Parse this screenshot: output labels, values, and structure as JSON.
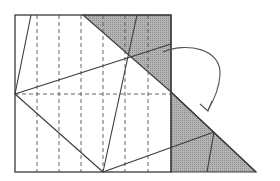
{
  "diagram": {
    "title": "",
    "type": "origami-fold-diagram",
    "colors": {
      "background": "#ffffff",
      "line": "#3a3a3a",
      "dashed": "#555555",
      "shade": "#a8a8a8"
    },
    "square": {
      "x1": 15,
      "y1": 15,
      "x2": 171,
      "y2": 172
    },
    "vertical_valley_folds_x": [
      37,
      59,
      81,
      103,
      125,
      148
    ],
    "horizontal_valley_fold_y": 94,
    "shaded_regions": [
      {
        "name": "top-right-flap",
        "points": "83,15 171,15 171,92"
      },
      {
        "name": "folded-triangle",
        "points": "171,92 256,172 171,172"
      }
    ],
    "crease_lines": [
      {
        "name": "left-top-edge-line",
        "x1": 31,
        "y1": 15,
        "x2": 15,
        "y2": 94
      },
      {
        "name": "left-to-bottom-diagonal",
        "x1": 15,
        "y1": 94,
        "x2": 103,
        "y2": 172
      },
      {
        "name": "left-to-right-rising",
        "x1": 15,
        "y1": 94,
        "x2": 171,
        "y2": 44
      },
      {
        "name": "top-to-bottom-steep",
        "x1": 137,
        "y1": 15,
        "x2": 103,
        "y2": 172
      },
      {
        "name": "bottom-to-triangle-rising",
        "x1": 103,
        "y1": 172,
        "x2": 214,
        "y2": 132
      },
      {
        "name": "triangle-inner-line",
        "x1": 214,
        "y1": 132,
        "x2": 207,
        "y2": 172
      },
      {
        "name": "triangle-hypotenuse",
        "x1": 171,
        "y1": 92,
        "x2": 256,
        "y2": 172
      }
    ],
    "arrow": {
      "name": "fold-over-arrow",
      "path": "M 163 52 C 185 42, 222 48, 220 75 C 219 90, 214 100, 208 110",
      "head": "M 200 104 L 208 111 L 212 101"
    }
  }
}
